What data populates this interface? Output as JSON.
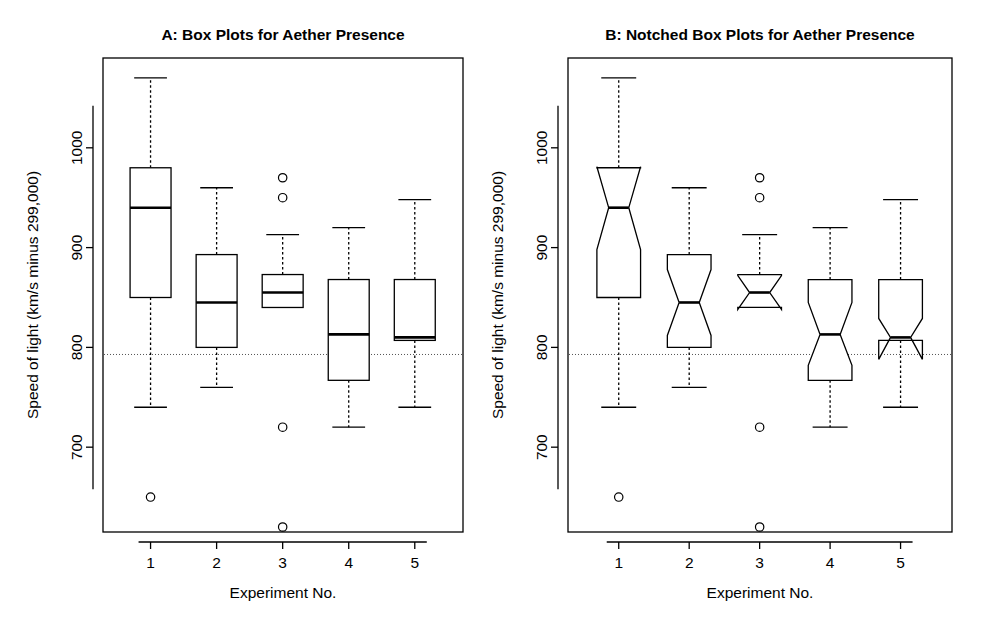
{
  "figure": {
    "background": "#ffffff",
    "ink_color": "#000000",
    "reference_line_color": "#555555"
  },
  "chart_data": [
    {
      "type": "box",
      "panel": "A",
      "title": "A: Box Plots for Aether Presence",
      "xlabel": "Experiment No.",
      "ylabel": "Speed of light (km/s minus 299,000)",
      "notched": false,
      "grid": false,
      "legend": "none",
      "categories": [
        "1",
        "2",
        "3",
        "4",
        "5"
      ],
      "xtick_labels": [
        "1",
        "2",
        "3",
        "4",
        "5"
      ],
      "ytick_labels": [
        "700",
        "800",
        "900",
        "1000"
      ],
      "yticks": [
        700,
        800,
        900,
        1000
      ],
      "ylim": [
        615,
        1090
      ],
      "reference_line": 792.9,
      "boxes": [
        {
          "category": "1",
          "whisker_low": 740,
          "q1": 850,
          "median": 940,
          "q3": 980,
          "whisker_high": 1070,
          "notch_low": 898,
          "notch_high": 981,
          "outliers": [
            650
          ]
        },
        {
          "category": "2",
          "whisker_low": 760,
          "q1": 800,
          "median": 845,
          "q3": 893,
          "whisker_high": 960,
          "notch_low": 812,
          "notch_high": 878,
          "outliers": []
        },
        {
          "category": "3",
          "whisker_low": 840,
          "q1": 840,
          "median": 855,
          "q3": 873,
          "whisker_high": 913,
          "notch_low": 838,
          "notch_high": 872,
          "outliers": [
            970,
            950,
            720,
            620
          ]
        },
        {
          "category": "4",
          "whisker_low": 720,
          "q1": 767,
          "median": 813,
          "q3": 868,
          "whisker_high": 920,
          "notch_low": 782,
          "notch_high": 845,
          "outliers": []
        },
        {
          "category": "5",
          "whisker_low": 740,
          "q1": 807,
          "median": 810,
          "q3": 868,
          "whisker_high": 948,
          "notch_low": 790,
          "notch_high": 830,
          "outliers": []
        }
      ]
    },
    {
      "type": "box",
      "panel": "B",
      "title": "B: Notched Box Plots for Aether Presence",
      "xlabel": "Experiment No.",
      "ylabel": "Speed of light (km/s minus 299,000)",
      "notched": true,
      "grid": false,
      "legend": "none",
      "categories": [
        "1",
        "2",
        "3",
        "4",
        "5"
      ],
      "xtick_labels": [
        "1",
        "2",
        "3",
        "4",
        "5"
      ],
      "ytick_labels": [
        "700",
        "800",
        "900",
        "1000"
      ],
      "yticks": [
        700,
        800,
        900,
        1000
      ],
      "ylim": [
        615,
        1090
      ],
      "reference_line": 792.9,
      "boxes": [
        {
          "category": "1",
          "whisker_low": 740,
          "q1": 850,
          "median": 940,
          "q3": 980,
          "whisker_high": 1070,
          "notch_low": 898,
          "notch_high": 981,
          "outliers": [
            650
          ]
        },
        {
          "category": "2",
          "whisker_low": 760,
          "q1": 800,
          "median": 845,
          "q3": 893,
          "whisker_high": 960,
          "notch_low": 812,
          "notch_high": 878,
          "outliers": []
        },
        {
          "category": "3",
          "whisker_low": 840,
          "q1": 840,
          "median": 855,
          "q3": 873,
          "whisker_high": 913,
          "notch_low": 838,
          "notch_high": 872,
          "outliers": [
            970,
            950,
            720,
            620
          ]
        },
        {
          "category": "4",
          "whisker_low": 720,
          "q1": 767,
          "median": 813,
          "q3": 868,
          "whisker_high": 920,
          "notch_low": 782,
          "notch_high": 845,
          "outliers": []
        },
        {
          "category": "5",
          "whisker_low": 740,
          "q1": 807,
          "median": 810,
          "q3": 868,
          "whisker_high": 948,
          "notch_low": 788,
          "notch_high": 829,
          "outliers": []
        }
      ]
    }
  ]
}
